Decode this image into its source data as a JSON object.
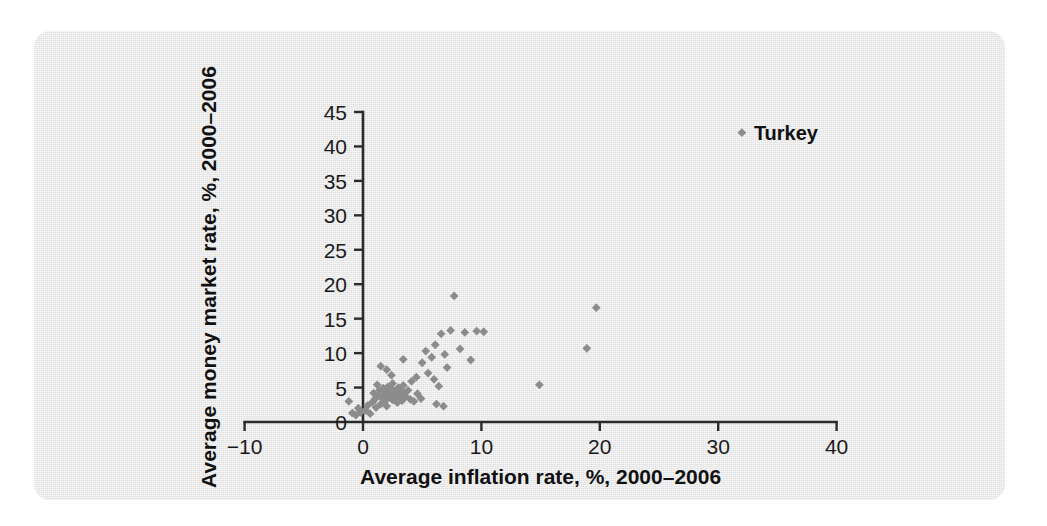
{
  "figure": {
    "panel_background": "#e9e9e9",
    "page_background": "#ffffff",
    "marker_color": "#8c8c8c",
    "axis_color": "#2b2b2b"
  },
  "chart_data": {
    "type": "scatter",
    "title": "",
    "xlabel": "Average inflation rate, %, 2000–2006",
    "ylabel": "Average money market rate, %, 2000–2006",
    "xlim": [
      -10,
      40
    ],
    "ylim": [
      0,
      45
    ],
    "xticks": [
      -10,
      0,
      10,
      20,
      30,
      40
    ],
    "xticklabels": [
      "−10",
      "0",
      "10",
      "20",
      "30",
      "40"
    ],
    "yticks": [
      0,
      5,
      10,
      15,
      20,
      25,
      30,
      35,
      40,
      45
    ],
    "yticklabels": [
      "0",
      "5",
      "10",
      "15",
      "20",
      "25",
      "30",
      "35",
      "40",
      "45"
    ],
    "grid": false,
    "legend": null,
    "annotations": [
      {
        "text": "Turkey",
        "x": 32.0,
        "y": 42.0,
        "marker": true
      }
    ],
    "points": [
      [
        -1.2,
        3.0
      ],
      [
        -0.9,
        1.3
      ],
      [
        -0.6,
        1.0
      ],
      [
        -0.4,
        2.0
      ],
      [
        -0.2,
        1.4
      ],
      [
        0.2,
        1.7
      ],
      [
        0.4,
        2.4
      ],
      [
        0.6,
        1.2
      ],
      [
        0.8,
        2.9
      ],
      [
        0.9,
        4.2
      ],
      [
        1.0,
        3.3
      ],
      [
        1.1,
        2.1
      ],
      [
        1.2,
        5.4
      ],
      [
        1.3,
        3.8
      ],
      [
        1.4,
        4.6
      ],
      [
        1.5,
        2.6
      ],
      [
        1.6,
        3.5
      ],
      [
        1.7,
        4.9
      ],
      [
        1.8,
        4.0
      ],
      [
        1.9,
        3.1
      ],
      [
        2.0,
        4.4
      ],
      [
        2.0,
        2.3
      ],
      [
        2.1,
        5.1
      ],
      [
        2.2,
        3.6
      ],
      [
        2.3,
        4.8
      ],
      [
        2.4,
        4.1
      ],
      [
        2.5,
        3.2
      ],
      [
        2.5,
        5.6
      ],
      [
        2.6,
        4.5
      ],
      [
        2.7,
        3.9
      ],
      [
        2.8,
        4.3
      ],
      [
        2.9,
        2.8
      ],
      [
        3.0,
        5.0
      ],
      [
        3.0,
        3.4
      ],
      [
        3.1,
        4.7
      ],
      [
        3.2,
        4.0
      ],
      [
        3.3,
        3.1
      ],
      [
        3.4,
        5.3
      ],
      [
        3.5,
        4.2
      ],
      [
        3.6,
        3.7
      ],
      [
        3.8,
        4.6
      ],
      [
        4.0,
        3.3
      ],
      [
        4.1,
        5.9
      ],
      [
        4.3,
        3.0
      ],
      [
        4.6,
        4.1
      ],
      [
        4.9,
        3.4
      ],
      [
        1.5,
        8.1
      ],
      [
        2.4,
        6.8
      ],
      [
        2.0,
        7.6
      ],
      [
        3.4,
        9.1
      ],
      [
        4.5,
        6.5
      ],
      [
        5.0,
        8.6
      ],
      [
        5.3,
        10.3
      ],
      [
        5.5,
        7.1
      ],
      [
        5.8,
        9.4
      ],
      [
        6.0,
        6.2
      ],
      [
        6.1,
        11.2
      ],
      [
        6.4,
        5.2
      ],
      [
        6.6,
        12.8
      ],
      [
        6.9,
        9.8
      ],
      [
        7.1,
        7.9
      ],
      [
        7.4,
        13.3
      ],
      [
        7.7,
        18.3
      ],
      [
        8.2,
        10.6
      ],
      [
        8.6,
        13.0
      ],
      [
        9.1,
        9.0
      ],
      [
        9.6,
        13.2
      ],
      [
        10.2,
        13.1
      ],
      [
        6.2,
        2.6
      ],
      [
        6.8,
        2.3
      ],
      [
        14.9,
        5.4
      ],
      [
        18.9,
        10.7
      ],
      [
        19.7,
        16.6
      ],
      [
        32.0,
        42.0
      ]
    ]
  }
}
